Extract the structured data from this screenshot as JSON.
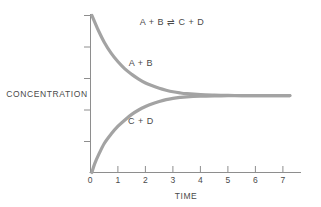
{
  "chart_data": {
    "type": "line",
    "title": "",
    "xlabel": "TIME",
    "ylabel": "CONCENTRATION",
    "xlim": [
      0,
      7.6
    ],
    "ylim": [
      0,
      1.0
    ],
    "grid": false,
    "legend": "inline-annotations",
    "x_ticks": [
      "0",
      "1",
      "2",
      "3",
      "4",
      "5",
      "6",
      "7"
    ],
    "x_tick_values": [
      0,
      1,
      2,
      3,
      4,
      5,
      6,
      7
    ],
    "y_ticks": [
      "",
      "",
      "",
      "",
      ""
    ],
    "y_tick_values": [
      0.2,
      0.4,
      0.6,
      0.8,
      1.0
    ],
    "equilibrium_value": 0.49,
    "equilibrium_time": 3,
    "annotations": [
      {
        "id": "equation",
        "text": "A + B ⇌ C + D",
        "x": 2.95,
        "y": 0.93
      },
      {
        "id": "reactants",
        "text": "A + B",
        "x": 2.05,
        "y": 0.72
      },
      {
        "id": "products",
        "text": "C + D",
        "x": 2.05,
        "y": 0.345
      }
    ],
    "series": [
      {
        "name": "A + B",
        "label": "A + B",
        "color": "#a3a3a3",
        "description": "reactant concentration decaying to equilibrium",
        "x": [
          0.05,
          0.15,
          0.3,
          0.5,
          0.75,
          1.0,
          1.25,
          1.5,
          1.75,
          2.0,
          2.25,
          2.5,
          2.75,
          3.0,
          3.25,
          3.5,
          4.0,
          4.5,
          5.0,
          5.5,
          6.0,
          6.5,
          7.0,
          7.25
        ],
        "y": [
          1.0,
          0.96,
          0.9,
          0.83,
          0.76,
          0.705,
          0.66,
          0.625,
          0.595,
          0.57,
          0.552,
          0.536,
          0.524,
          0.514,
          0.507,
          0.502,
          0.496,
          0.493,
          0.491,
          0.49,
          0.49,
          0.49,
          0.49,
          0.49
        ]
      },
      {
        "name": "C + D",
        "label": "C + D",
        "color": "#a3a3a3",
        "description": "product concentration rising to equilibrium",
        "x": [
          0.05,
          0.15,
          0.3,
          0.5,
          0.75,
          1.0,
          1.25,
          1.5,
          1.75,
          2.0,
          2.25,
          2.5,
          2.75,
          3.0,
          3.25,
          3.5,
          4.0,
          4.5,
          5.0,
          5.5,
          6.0,
          6.5,
          7.0,
          7.25
        ],
        "y": [
          0.0,
          0.055,
          0.115,
          0.185,
          0.245,
          0.295,
          0.335,
          0.37,
          0.398,
          0.42,
          0.438,
          0.452,
          0.464,
          0.472,
          0.478,
          0.482,
          0.486,
          0.488,
          0.489,
          0.49,
          0.49,
          0.49,
          0.49,
          0.49
        ]
      }
    ]
  },
  "labels": {
    "x_axis_title": "TIME",
    "y_axis_title": "CONCENTRATION",
    "equation": "A + B ⇌ C + D",
    "upper_curve": "A + B",
    "lower_curve": "C + D",
    "tick_0": "0",
    "tick_1": "1",
    "tick_2": "2",
    "tick_3": "3",
    "tick_4": "4",
    "tick_5": "5",
    "tick_6": "6",
    "tick_7": "7"
  },
  "colors": {
    "curve": "#a3a3a3",
    "axis": "#8e8e8e",
    "text": "#4a4a4a",
    "background": "#ffffff"
  }
}
